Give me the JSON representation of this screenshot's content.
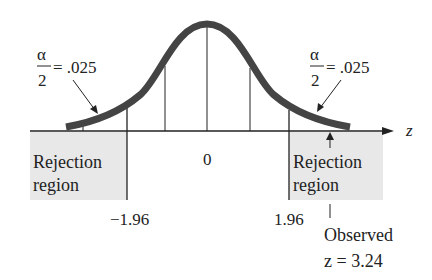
{
  "diagram": {
    "axis_label": "z",
    "center_label": "0",
    "left_tail": {
      "fraction_numerator": "α",
      "fraction_denominator": "2",
      "equals_value": "= .025",
      "region_line1": "Rejection",
      "region_line2": "region",
      "critical_value": "−1.96"
    },
    "right_tail": {
      "fraction_numerator": "α",
      "fraction_denominator": "2",
      "equals_value": "= .025",
      "region_line1": "Rejection",
      "region_line2": "region",
      "critical_value": "1.96"
    },
    "observed": {
      "line1": "Observed",
      "line2": "z = 3.24"
    },
    "colors": {
      "curve": "#444444",
      "lines": "#222222",
      "shade": "#e6e6e6"
    }
  }
}
